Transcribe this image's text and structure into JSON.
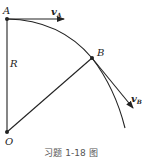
{
  "figure": {
    "caption": "习题 1-18 图",
    "points": {
      "A": {
        "label": "A",
        "x": 7,
        "y": 19
      },
      "B": {
        "label": "B",
        "x": 92,
        "y": 58
      },
      "O": {
        "label": "O",
        "x": 7,
        "y": 132
      }
    },
    "radius_label": "R",
    "velocity_A": {
      "symbol": "v",
      "subscript": "A"
    },
    "velocity_B": {
      "symbol": "v",
      "subscript": "B"
    },
    "colors": {
      "stroke": "#222222",
      "caption": "#555555"
    }
  }
}
